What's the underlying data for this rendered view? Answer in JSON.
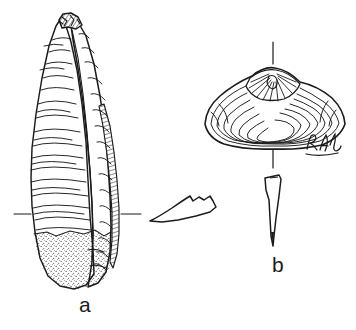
{
  "figure": {
    "kind": "scientific-illustration",
    "medium": "pen-and-ink line drawing",
    "background_color": "#ffffff",
    "ink_color": "#1b1b1b",
    "stipple_color": "#3a3a3a",
    "panels": [
      {
        "label": "a",
        "subject": "elongate bivalve shell, exterior view, vertically oriented",
        "features": [
          "truncated angular apex with dark shading",
          "two overlapping elongate valves",
          "numerous transverse growth lines",
          "narrow hatched strip along right margin",
          "stippled broken basal surface"
        ],
        "tick_marks": "paired horizontal registration ticks at mid-height"
      },
      {
        "label": "b",
        "subject": "rounded-triangular bivalve shell, exterior view, horizontally oriented",
        "features": [
          "peaked umbo with radially hatched oval beak area",
          "concentric growth lines across the disc",
          "rounded anterior and posterior margins"
        ],
        "tick_marks": "vertical midline ticks above and below the shell",
        "signature": "RAL"
      }
    ],
    "insets": [
      {
        "name": "valve-cross-section",
        "subject": "thin curved cross-section profile of shell valve"
      },
      {
        "name": "tapering-profile",
        "subject": "narrow tapering end-on profile of specimen b"
      }
    ],
    "labels": {
      "a": "a",
      "b": "b",
      "signature": "RAL"
    }
  }
}
